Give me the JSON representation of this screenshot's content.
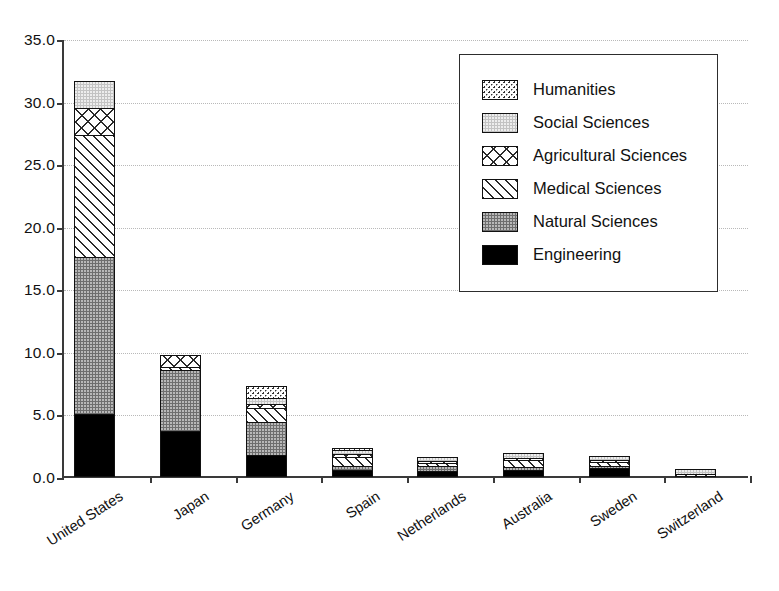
{
  "chart_data": {
    "type": "bar",
    "subtype": "stacked",
    "title": "",
    "xlabel": "",
    "ylabel": "",
    "ylim": [
      0.0,
      35.0
    ],
    "y_ticks": [
      "0.0",
      "5.0",
      "10.0",
      "15.0",
      "20.0",
      "25.0",
      "30.0",
      "35.0"
    ],
    "y_tick_values": [
      0,
      5,
      10,
      15,
      20,
      25,
      30,
      35
    ],
    "grid": true,
    "legend_position": "upper right",
    "categories": [
      "United States",
      "Japan",
      "Germany",
      "Spain",
      "Netherlands",
      "Australia",
      "Sweden",
      "Switzerland"
    ],
    "series": [
      {
        "name": "Engineering",
        "key": "engineering",
        "values": [
          5.0,
          3.7,
          1.75,
          0.6,
          0.45,
          0.55,
          0.75,
          0.0
        ]
      },
      {
        "name": "Natural Sciences",
        "key": "natural",
        "values": [
          12.7,
          4.9,
          2.75,
          0.35,
          0.55,
          0.35,
          0.25,
          0.0
        ]
      },
      {
        "name": "Medical Sciences",
        "key": "medical",
        "values": [
          9.8,
          0.35,
          1.2,
          0.85,
          0.25,
          0.6,
          0.4,
          0.25
        ]
      },
      {
        "name": "Agricultural Sciences",
        "key": "agricultural",
        "values": [
          2.2,
          1.05,
          0.35,
          0.25,
          0.15,
          0.2,
          0.2,
          0.0
        ]
      },
      {
        "name": "Social Sciences",
        "key": "social",
        "values": [
          2.3,
          0.0,
          0.55,
          0.4,
          0.4,
          0.5,
          0.4,
          0.45
        ]
      },
      {
        "name": "Humanities",
        "key": "humanities",
        "values": [
          0.0,
          0.0,
          1.1,
          0.2,
          0.0,
          0.0,
          0.0,
          0.0
        ]
      }
    ],
    "totals": [
      32.0,
      10.0,
      8.5,
      2.65,
      1.8,
      2.2,
      2.0,
      0.7
    ]
  },
  "legend": {
    "items": [
      {
        "label": "Humanities",
        "key": "humanities"
      },
      {
        "label": "Social Sciences",
        "key": "social"
      },
      {
        "label": "Agricultural Sciences",
        "key": "agricultural"
      },
      {
        "label": "Medical Sciences",
        "key": "medical"
      },
      {
        "label": "Natural Sciences",
        "key": "natural"
      },
      {
        "label": "Engineering",
        "key": "engineering"
      }
    ]
  },
  "colors": {
    "axis": "#3a3a3a",
    "grid": "#b9b9b9",
    "text": "#111111",
    "engineering": "#000000",
    "natural": "#6e6e6e",
    "medical": "#ffffff",
    "agricultural": "#ffffff",
    "social": "#c3c3c3",
    "humanities": "#ffffff"
  }
}
